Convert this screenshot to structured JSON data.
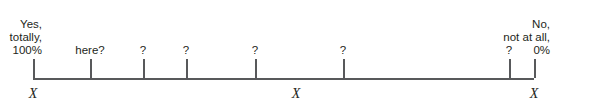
{
  "figure": {
    "type": "scale-line",
    "axis": {
      "start_x": 33,
      "end_x": 534,
      "baseline_y": 78,
      "color": "#58595b"
    },
    "left_anchor": {
      "line1": "Yes,",
      "line2": "totally,",
      "line3": "100%"
    },
    "right_anchor": {
      "line1": "No,",
      "line2": "not at all,",
      "line3": "0%"
    },
    "ticks": [
      {
        "x": 33,
        "label": "",
        "kind": "anchor-left"
      },
      {
        "x": 90,
        "label": "here?",
        "kind": "query"
      },
      {
        "x": 143,
        "label": "?",
        "kind": "query"
      },
      {
        "x": 186,
        "label": "?",
        "kind": "query"
      },
      {
        "x": 255,
        "label": "?",
        "kind": "query"
      },
      {
        "x": 343,
        "label": "?",
        "kind": "query"
      },
      {
        "x": 509,
        "label": "?",
        "kind": "query"
      },
      {
        "x": 534,
        "label": "",
        "kind": "anchor-right"
      }
    ],
    "x_marks": [
      {
        "x": 33,
        "glyph": "X"
      },
      {
        "x": 296,
        "glyph": "X"
      },
      {
        "x": 534,
        "glyph": "X"
      }
    ]
  }
}
